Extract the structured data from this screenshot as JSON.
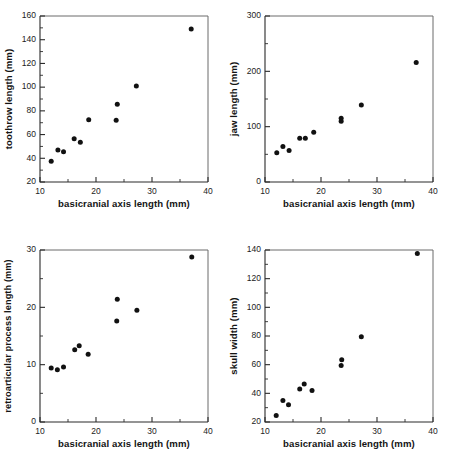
{
  "figure": {
    "type": "multi-panel-scatter-figure",
    "panel_count": 4,
    "background_color": "#ffffff",
    "point_color": "#111111",
    "axis_color": "#2b2b2b"
  },
  "chart_data": [
    {
      "panel": "top-left",
      "type": "scatter",
      "title": "",
      "xlabel": "basicranial axis length (mm)",
      "ylabel": "toothrow length (mm)",
      "xlim": [
        10,
        40
      ],
      "ylim": [
        20,
        160
      ],
      "xticks": [
        10,
        20,
        30,
        40
      ],
      "yticks": [
        20,
        40,
        60,
        80,
        100,
        120,
        140,
        160
      ],
      "xminorticks": [
        15,
        25,
        35
      ],
      "yminorticks": [
        30,
        50,
        70,
        90,
        110,
        130,
        150
      ],
      "grid": false,
      "legend": false,
      "x": [
        12.0,
        13.2,
        14.2,
        16.1,
        17.2,
        18.7,
        23.6,
        23.8,
        27.2,
        37.0
      ],
      "values": [
        37.5,
        47.0,
        45.5,
        56.5,
        53.5,
        72.5,
        72.0,
        85.5,
        101.0,
        149.0
      ]
    },
    {
      "panel": "top-right",
      "type": "scatter",
      "title": "",
      "xlabel": "basicranial axis length (mm)",
      "ylabel": "jaw length (mm)",
      "xlim": [
        10,
        40
      ],
      "ylim": [
        0,
        300
      ],
      "xticks": [
        10,
        20,
        30,
        40
      ],
      "yticks": [
        0,
        100,
        200,
        300
      ],
      "xminorticks": [
        15,
        25,
        35
      ],
      "yminorticks": [
        50,
        150,
        250
      ],
      "grid": false,
      "legend": false,
      "x": [
        12.1,
        13.2,
        14.3,
        16.2,
        17.2,
        18.7,
        23.6,
        23.6,
        27.2,
        37.0
      ],
      "values": [
        53.0,
        64.0,
        57.0,
        79.0,
        79.0,
        90.0,
        110.0,
        115.0,
        139.0,
        216.0
      ]
    },
    {
      "panel": "bottom-left",
      "type": "scatter",
      "title": "",
      "xlabel": "basicranial axis length (mm)",
      "ylabel": "retroarticular process length (mm)",
      "xlim": [
        10,
        40
      ],
      "ylim": [
        0,
        30
      ],
      "xticks": [
        10,
        20,
        30,
        40
      ],
      "yticks": [
        0,
        10,
        20,
        30
      ],
      "xminorticks": [
        15,
        25,
        35
      ],
      "yminorticks": [
        5,
        15,
        25
      ],
      "grid": false,
      "legend": false,
      "x": [
        12.0,
        13.1,
        14.2,
        16.2,
        17.0,
        18.6,
        23.7,
        23.8,
        27.3,
        37.1
      ],
      "values": [
        9.4,
        9.1,
        9.6,
        12.6,
        13.3,
        11.8,
        17.6,
        21.4,
        19.5,
        28.8
      ]
    },
    {
      "panel": "bottom-right",
      "type": "scatter",
      "title": "",
      "xlabel": "basicranial axis length (mm)",
      "ylabel": "skull width (mm)",
      "xlim": [
        10,
        40
      ],
      "ylim": [
        20,
        140
      ],
      "xticks": [
        10,
        20,
        30,
        40
      ],
      "yticks": [
        20,
        40,
        60,
        80,
        100,
        120,
        140
      ],
      "xminorticks": [
        15,
        25,
        35
      ],
      "yminorticks": [
        30,
        50,
        70,
        90,
        110,
        130
      ],
      "grid": false,
      "legend": false,
      "x": [
        12.0,
        13.2,
        14.2,
        16.2,
        17.0,
        18.4,
        23.6,
        23.7,
        27.2,
        37.2
      ],
      "values": [
        24.5,
        35.0,
        32.0,
        43.0,
        46.5,
        42.0,
        59.5,
        63.5,
        79.5,
        137.5
      ]
    }
  ]
}
